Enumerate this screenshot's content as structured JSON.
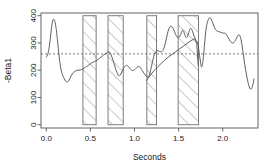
{
  "chart_data": {
    "type": "line",
    "title": "",
    "subtitle": "",
    "xlabel": "Seconds",
    "ylabel": "-Beta1",
    "xlim": [
      -0.06,
      2.4
    ],
    "ylim": [
      -12,
      410
    ],
    "xticks": [
      0.0,
      0.5,
      1.0,
      1.5,
      2.0
    ],
    "xticklabels": [
      "0.0",
      "0.5",
      "1.0",
      "1.5",
      "2.0"
    ],
    "yticks": [
      0,
      100,
      200,
      300,
      400
    ],
    "yticklabels": [
      "0",
      "100",
      "200",
      "300",
      "400"
    ],
    "grid": false,
    "legend": null,
    "box": true,
    "line_color": "#4d4d4d",
    "reference_line": {
      "type": "horizontal-dashed",
      "y": 260,
      "color": "#6e6e6e",
      "dash": "2,2"
    },
    "shaded_intervals": [
      {
        "x0": 0.415,
        "x1": 0.565,
        "y0": 0,
        "y1": 400,
        "hatch": "diagonal-45",
        "edge_color": "#6e6e6e",
        "fill": "none"
      },
      {
        "x0": 0.7,
        "x1": 0.872,
        "y0": 0,
        "y1": 400,
        "hatch": "diagonal-45",
        "edge_color": "#6e6e6e",
        "fill": "none"
      },
      {
        "x0": 1.14,
        "x1": 1.25,
        "y0": 0,
        "y1": 400,
        "hatch": "diagonal-45",
        "edge_color": "#6e6e6e",
        "fill": "none"
      },
      {
        "x0": 1.495,
        "x1": 1.725,
        "y0": 0,
        "y1": 400,
        "hatch": "diagonal-45",
        "edge_color": "#6e6e6e",
        "fill": "none"
      }
    ],
    "series": [
      {
        "name": "-Beta1",
        "x": [
          0.0,
          0.02,
          0.04,
          0.058,
          0.072,
          0.086,
          0.1,
          0.115,
          0.13,
          0.145,
          0.16,
          0.175,
          0.19,
          0.205,
          0.22,
          0.235,
          0.25,
          0.265,
          0.28,
          0.295,
          0.31,
          0.325,
          0.34,
          0.355,
          0.37,
          0.385,
          0.4,
          0.415,
          0.43,
          0.445,
          0.46,
          0.478,
          0.495,
          0.512,
          0.528,
          0.545,
          0.56,
          0.575,
          0.59,
          0.605,
          0.62,
          0.635,
          0.65,
          0.665,
          0.68,
          0.695,
          0.71,
          0.725,
          0.74,
          0.755,
          0.77,
          0.785,
          0.8,
          0.815,
          0.83,
          0.845,
          0.86,
          0.875,
          0.89,
          0.905,
          0.92,
          0.935,
          0.95,
          0.965,
          0.98,
          0.998,
          1.015,
          1.03,
          1.045,
          1.06,
          1.075,
          1.09,
          1.105,
          1.12,
          1.135,
          1.15,
          1.165,
          1.18,
          1.195,
          1.21,
          1.225,
          1.24,
          1.255,
          1.272,
          1.288,
          1.305,
          1.32,
          1.335,
          1.35,
          1.365,
          1.38,
          1.395,
          1.412,
          1.428,
          1.445,
          1.46,
          1.475,
          1.492,
          1.508,
          1.525,
          1.54,
          1.555,
          1.57,
          1.585,
          1.6,
          1.615,
          1.63,
          1.645,
          1.66,
          1.675,
          1.69,
          1.705,
          1.718,
          1.73,
          1.745,
          1.76,
          1.778,
          1.795,
          1.812,
          1.83,
          1.848,
          1.865,
          1.882,
          1.9,
          1.918,
          1.935,
          1.952,
          1.97,
          1.988,
          2.005,
          2.022,
          2.04,
          2.058,
          2.075,
          2.092,
          2.11,
          2.128,
          2.145,
          2.162,
          2.18,
          2.198,
          2.215,
          2.232,
          2.25,
          2.268,
          2.285,
          2.302,
          2.32,
          2.338,
          2.355
        ],
        "y": [
          248,
          262,
          300,
          352,
          381,
          387,
          375,
          345,
          300,
          252,
          215,
          192,
          178,
          168,
          160,
          157,
          160,
          168,
          178,
          186,
          192,
          196,
          199,
          200,
          200,
          201,
          203,
          205,
          208,
          211,
          214,
          218,
          222,
          226,
          229,
          232,
          234,
          237,
          240,
          244,
          248,
          252,
          256,
          259,
          262,
          266,
          268,
          263,
          252,
          238,
          222,
          206,
          192,
          182,
          180,
          186,
          196,
          206,
          214,
          218,
          216,
          212,
          206,
          201,
          199,
          201,
          206,
          211,
          214,
          212,
          206,
          198,
          190,
          183,
          178,
          175,
          180,
          196,
          218,
          240,
          258,
          266,
          272,
          271,
          268,
          268,
          272,
          282,
          300,
          322,
          342,
          356,
          362,
          358,
          348,
          336,
          326,
          320,
          322,
          332,
          346,
          344,
          330,
          320,
          324,
          338,
          352,
          352,
          340,
          326,
          314,
          306,
          300,
          272,
          238,
          212,
          238,
          300,
          352,
          380,
          392,
          390,
          378,
          362,
          350,
          344,
          342,
          340,
          338,
          336,
          336,
          332,
          322,
          312,
          304,
          300,
          302,
          310,
          322,
          330,
          324,
          300,
          262,
          220,
          186,
          158,
          138,
          130,
          142,
          168
        ],
        "smoothed": true
      },
      {
        "name": "-Beta1-segment",
        "x": [
          1.135,
          1.16,
          1.19,
          1.225,
          1.262,
          1.3,
          1.34,
          1.382,
          1.425,
          1.468,
          1.51,
          1.552,
          1.595,
          1.638,
          1.68,
          1.705,
          1.722
        ],
        "y": [
          162,
          172,
          186,
          200,
          212,
          224,
          236,
          248,
          258,
          268,
          278,
          288,
          298,
          308,
          316,
          300,
          218
        ],
        "smoothed": false
      }
    ]
  },
  "axes": {
    "xlabel": "Seconds",
    "ylabel": "-Beta1"
  }
}
